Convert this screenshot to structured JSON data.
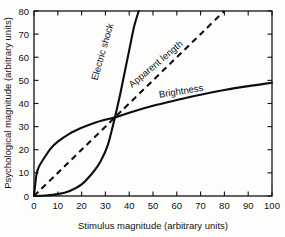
{
  "chart_data": {
    "type": "line",
    "title": "",
    "xlabel": "Stimulus magnitude  (arbitrary units)",
    "ylabel": "Psychological magnitude  (arbitrary units)",
    "xlim": [
      0,
      100
    ],
    "ylim": [
      0,
      80
    ],
    "grid": false,
    "legend_position": "inline-curve-labels",
    "xticks": [
      0,
      10,
      20,
      30,
      40,
      50,
      60,
      70,
      80,
      90,
      100
    ],
    "ytick_labels": [
      "0",
      "10",
      "20",
      "30",
      "40",
      "50",
      "60",
      "70",
      "80"
    ],
    "xtick_labels": [
      "0",
      "10",
      "20",
      "30",
      "40",
      "50",
      "60",
      "70",
      "80",
      "90",
      "100"
    ],
    "yticks": [
      0,
      10,
      20,
      30,
      40,
      50,
      60,
      70,
      80
    ],
    "annotations": [
      {
        "text": "Electric shock",
        "x": 30,
        "y": 62,
        "rotation": -74
      },
      {
        "text": "Apparent length",
        "x": 52,
        "y": 56,
        "rotation": -40
      },
      {
        "text": "Brightness",
        "x": 62,
        "y": 44,
        "rotation": -9
      }
    ],
    "series": [
      {
        "name": "Electric shock",
        "style": "solid",
        "exponent": 3.5,
        "description": "Expansive power function, rises steeply and exits the top of the frame near x=44",
        "x": [
          0,
          5,
          10,
          15,
          20,
          25,
          28,
          31,
          34,
          36,
          38,
          40,
          42,
          44
        ],
        "values": [
          0,
          0.2,
          0.8,
          2.2,
          5.0,
          10.5,
          15.0,
          22.0,
          34.0,
          43.0,
          53.0,
          63.0,
          73.0,
          80.0
        ]
      },
      {
        "name": "Apparent length",
        "style": "dashed",
        "exponent": 1.0,
        "description": "Linear function through the origin, exits the top of the frame near x=80",
        "x": [
          0,
          10,
          20,
          30,
          34,
          40,
          50,
          60,
          70,
          80
        ],
        "values": [
          0,
          10.0,
          20.0,
          30.0,
          34.0,
          40.0,
          50.0,
          60.0,
          70.0,
          80.0
        ]
      },
      {
        "name": "Brightness",
        "style": "solid",
        "exponent": 0.33,
        "description": "Compressive power function, rises sharply then flattens to about 49 at x=100",
        "x": [
          0,
          1,
          2,
          4,
          7,
          10,
          15,
          20,
          25,
          30,
          34,
          40,
          50,
          60,
          70,
          80,
          90,
          100
        ],
        "values": [
          0,
          9.0,
          12.5,
          16.0,
          20.5,
          23.5,
          27.0,
          29.5,
          31.5,
          33.0,
          34.0,
          36.0,
          39.0,
          41.5,
          43.8,
          45.8,
          47.5,
          49.0
        ]
      }
    ]
  }
}
